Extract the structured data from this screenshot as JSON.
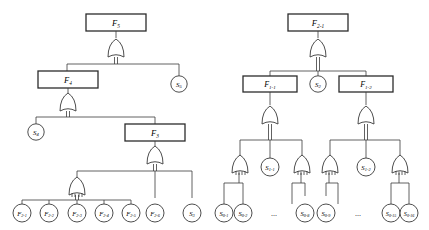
{
  "diagram": {
    "type": "fault-tree",
    "title_visible": false,
    "background_color": "#ffffff",
    "line_color": "#3a3a3a",
    "box_border_color": "#2b2b2b",
    "gate_symbol": "OR",
    "left_tree": {
      "root": {
        "id": "F5",
        "shape": "rect",
        "label": "F",
        "sub": "5"
      },
      "boxes": [
        {
          "id": "F5",
          "label": "F",
          "sub": "5"
        },
        {
          "id": "F4",
          "label": "F",
          "sub": "4"
        },
        {
          "id": "F3",
          "label": "F",
          "sub": "3"
        }
      ],
      "circles": [
        {
          "id": "S5",
          "label": "S",
          "sub": "5"
        },
        {
          "id": "S4",
          "label": "S",
          "sub": "4"
        },
        {
          "id": "S3",
          "label": "S",
          "sub": "3"
        },
        {
          "id": "F2-1",
          "label": "F",
          "sub": "2-1"
        },
        {
          "id": "F2-2",
          "label": "F",
          "sub": "2-2"
        },
        {
          "id": "F2-3",
          "label": "F",
          "sub": "2-3"
        },
        {
          "id": "F2-4",
          "label": "F",
          "sub": "2-4"
        },
        {
          "id": "F2-5",
          "label": "F",
          "sub": "2-5"
        },
        {
          "id": "F2-6",
          "label": "F",
          "sub": "2-6"
        }
      ],
      "edges": [
        {
          "from": "F5",
          "to": [
            "F4",
            "S5"
          ]
        },
        {
          "from": "F4",
          "to": [
            "S4",
            "F3"
          ]
        },
        {
          "from": "F3",
          "to": [
            "G2-1-5",
            "F2-6",
            "S3"
          ]
        },
        {
          "from": "G2-1-5",
          "to": [
            "F2-1",
            "F2-2",
            "F2-3",
            "F2-4",
            "F2-5"
          ]
        }
      ]
    },
    "right_tree": {
      "root": {
        "id": "F2-1r",
        "shape": "rect",
        "label": "F",
        "sub": "2-1"
      },
      "boxes": [
        {
          "id": "F2-1r",
          "label": "F",
          "sub": "2-1"
        },
        {
          "id": "F1-1",
          "label": "F",
          "sub": "1-1"
        },
        {
          "id": "F1-2",
          "label": "F",
          "sub": "1-2"
        }
      ],
      "circles": [
        {
          "id": "S2",
          "label": "S",
          "sub": "2"
        },
        {
          "id": "S1-1",
          "label": "S",
          "sub": "1-1"
        },
        {
          "id": "S1-2",
          "label": "S",
          "sub": "1-2"
        },
        {
          "id": "S0-1",
          "label": "S",
          "sub": "0-1"
        },
        {
          "id": "S0-2",
          "label": "S",
          "sub": "0-2"
        },
        {
          "id": "S0-8",
          "label": "S",
          "sub": "0-8"
        },
        {
          "id": "S0-9",
          "label": "S",
          "sub": "0-9"
        },
        {
          "id": "S0-15",
          "label": "S",
          "sub": "0-15"
        },
        {
          "id": "S0-16",
          "label": "S",
          "sub": "0-16"
        }
      ],
      "ellipses": [
        "...",
        "..."
      ],
      "edges": [
        {
          "from": "F2-1r",
          "to": [
            "F1-1",
            "S2",
            "F1-2"
          ]
        },
        {
          "from": "F1-1",
          "to": [
            "GA",
            "S1-1",
            "GB"
          ]
        },
        {
          "from": "F1-2",
          "to": [
            "GC",
            "S1-2",
            "GD"
          ]
        },
        {
          "from": "GA",
          "to": [
            "S0-1",
            "S0-2"
          ]
        },
        {
          "from": "GB",
          "to": [
            "S0-8"
          ]
        },
        {
          "from": "GC",
          "to": [
            "S0-9"
          ]
        },
        {
          "from": "GD",
          "to": [
            "S0-15",
            "S0-16"
          ]
        }
      ]
    },
    "ellipsis_text": "..."
  }
}
